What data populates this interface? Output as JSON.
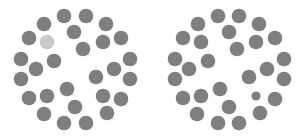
{
  "puzzle": {
    "type": "spot-the-difference",
    "colors": {
      "background": "#ffffff",
      "dot": "#7f7f7f",
      "dot_light": "#c9c9c9"
    },
    "default_radius": 7.3,
    "panels": [
      {
        "name": "left-panel",
        "dots": [
          {
            "x": 64,
            "y": 16
          },
          {
            "x": 86,
            "y": 16
          },
          {
            "x": 44,
            "y": 24
          },
          {
            "x": 106,
            "y": 24
          },
          {
            "x": 74,
            "y": 32
          },
          {
            "x": 29,
            "y": 38
          },
          {
            "x": 47,
            "y": 42,
            "light": true
          },
          {
            "x": 103,
            "y": 42
          },
          {
            "x": 121,
            "y": 38
          },
          {
            "x": 83,
            "y": 49
          },
          {
            "x": 21,
            "y": 59
          },
          {
            "x": 54,
            "y": 61
          },
          {
            "x": 130,
            "y": 59
          },
          {
            "x": 36,
            "y": 69
          },
          {
            "x": 114,
            "y": 69
          },
          {
            "x": 21,
            "y": 79
          },
          {
            "x": 96,
            "y": 77
          },
          {
            "x": 130,
            "y": 79
          },
          {
            "x": 67,
            "y": 89
          },
          {
            "x": 29,
            "y": 98
          },
          {
            "x": 47,
            "y": 96
          },
          {
            "x": 103,
            "y": 96
          },
          {
            "x": 121,
            "y": 99
          },
          {
            "x": 75,
            "y": 107
          },
          {
            "x": 44,
            "y": 114
          },
          {
            "x": 107,
            "y": 113
          },
          {
            "x": 64,
            "y": 123
          },
          {
            "x": 86,
            "y": 123
          }
        ]
      },
      {
        "name": "right-panel",
        "dots": [
          {
            "x": 218,
            "y": 16
          },
          {
            "x": 239,
            "y": 16
          },
          {
            "x": 198,
            "y": 24
          },
          {
            "x": 259,
            "y": 24
          },
          {
            "x": 229,
            "y": 32
          },
          {
            "x": 183,
            "y": 38
          },
          {
            "x": 201,
            "y": 42
          },
          {
            "x": 256,
            "y": 42
          },
          {
            "x": 275,
            "y": 38
          },
          {
            "x": 237,
            "y": 49
          },
          {
            "x": 175,
            "y": 59
          },
          {
            "x": 208,
            "y": 61
          },
          {
            "x": 284,
            "y": 59
          },
          {
            "x": 189,
            "y": 69
          },
          {
            "x": 267,
            "y": 69
          },
          {
            "x": 175,
            "y": 79
          },
          {
            "x": 249,
            "y": 77
          },
          {
            "x": 284,
            "y": 79
          },
          {
            "x": 220,
            "y": 89
          },
          {
            "x": 183,
            "y": 98
          },
          {
            "x": 201,
            "y": 96
          },
          {
            "x": 256,
            "y": 96,
            "r": 4.6
          },
          {
            "x": 275,
            "y": 99
          },
          {
            "x": 229,
            "y": 107
          },
          {
            "x": 197,
            "y": 114
          },
          {
            "x": 260,
            "y": 113
          },
          {
            "x": 218,
            "y": 123
          },
          {
            "x": 239,
            "y": 123
          }
        ]
      }
    ]
  }
}
